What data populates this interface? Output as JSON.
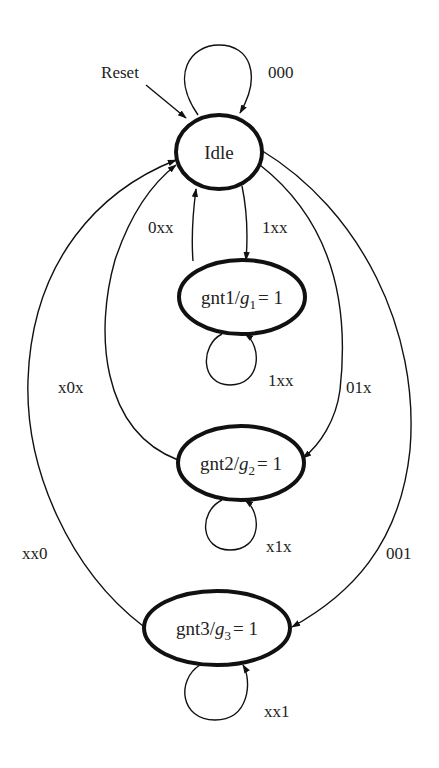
{
  "diagram": {
    "type": "finite-state-machine",
    "initial_arrow_label": "Reset",
    "states": [
      {
        "id": "idle",
        "label": "Idle",
        "output_var": "",
        "output_sub": "",
        "output_val": ""
      },
      {
        "id": "gnt1",
        "label": "gnt1/",
        "output_var": "g",
        "output_sub": "1",
        "output_val": "= 1"
      },
      {
        "id": "gnt2",
        "label": "gnt2/",
        "output_var": "g",
        "output_sub": "2",
        "output_val": "= 1"
      },
      {
        "id": "gnt3",
        "label": "gnt3/",
        "output_var": "g",
        "output_sub": "3",
        "output_val": "= 1"
      }
    ],
    "transitions": [
      {
        "from": "idle",
        "to": "idle",
        "label": "000"
      },
      {
        "from": "idle",
        "to": "gnt1",
        "label": "1xx"
      },
      {
        "from": "gnt1",
        "to": "idle",
        "label": "0xx"
      },
      {
        "from": "gnt1",
        "to": "gnt1",
        "label": "1xx"
      },
      {
        "from": "idle",
        "to": "gnt2",
        "label": "01x"
      },
      {
        "from": "gnt2",
        "to": "idle",
        "label": "x0x"
      },
      {
        "from": "gnt2",
        "to": "gnt2",
        "label": "x1x"
      },
      {
        "from": "idle",
        "to": "gnt3",
        "label": "001"
      },
      {
        "from": "gnt3",
        "to": "idle",
        "label": "xx0"
      },
      {
        "from": "gnt3",
        "to": "gnt3",
        "label": "xx1"
      }
    ]
  }
}
